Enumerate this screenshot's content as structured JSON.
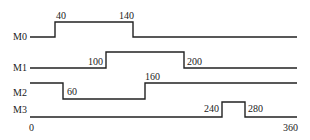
{
  "diagram": {
    "type": "timing",
    "time_axis": {
      "start_label": "0",
      "end_label": "360"
    },
    "signals": [
      {
        "name": "M0",
        "initial": "low",
        "transitions": [
          {
            "t": 40,
            "label": "40",
            "to": "high"
          },
          {
            "t": 140,
            "label": "140",
            "to": "low"
          }
        ]
      },
      {
        "name": "M1",
        "initial": "low",
        "transitions": [
          {
            "t": 100,
            "label": "100",
            "to": "high"
          },
          {
            "t": 200,
            "label": "200",
            "to": "low"
          }
        ]
      },
      {
        "name": "M2",
        "initial": "high",
        "transitions": [
          {
            "t": 60,
            "label": "60",
            "to": "low"
          },
          {
            "t": 160,
            "label": "160",
            "to": "high"
          }
        ]
      },
      {
        "name": "M3",
        "initial": "low",
        "transitions": [
          {
            "t": 240,
            "label": "240",
            "to": "high"
          },
          {
            "t": 280,
            "label": "280",
            "to": "low"
          }
        ]
      }
    ],
    "colors": {
      "line": "#222222",
      "background": "#ffffff"
    }
  }
}
